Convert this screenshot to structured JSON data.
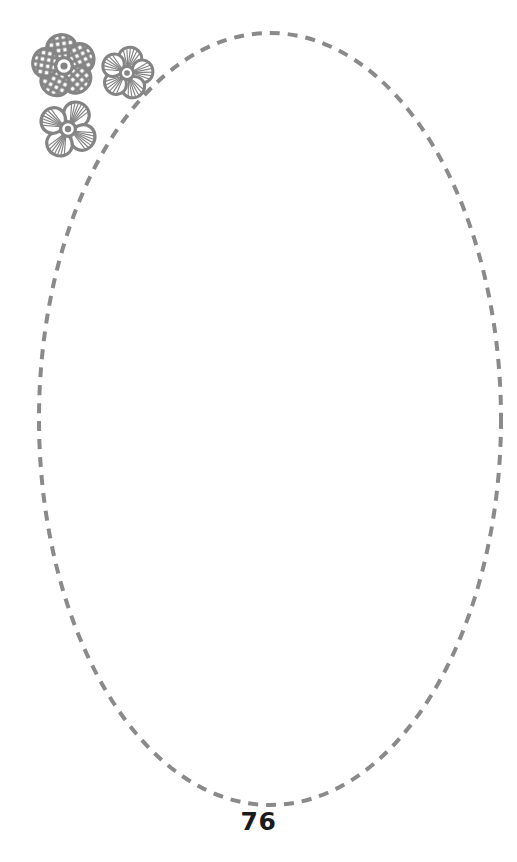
{
  "page": {
    "number": "76",
    "width": 517,
    "height": 862,
    "background_color": "#ffffff"
  },
  "frame": {
    "name": "dashed-oval-frame",
    "shape": "ellipse",
    "center_x": 270,
    "center_y": 419,
    "radius_x": 231,
    "radius_y": 386,
    "stroke_color": "#8a8a8a",
    "stroke_width": 4,
    "dash_length": 10,
    "dash_gap": 8,
    "fill": "none"
  },
  "decoration": {
    "name": "flower-cluster",
    "color": "#848484",
    "count": 3,
    "flowers": [
      {
        "name": "flower-large-dashed-petals",
        "center_x": 64,
        "center_y": 66,
        "radius": 29,
        "petals": 5,
        "petal_texture": "dashed-blocks",
        "center_ring": true
      },
      {
        "name": "flower-small-striped-petals",
        "center_x": 127,
        "center_y": 73,
        "radius": 24,
        "petals": 5,
        "petal_texture": "radiating-lines",
        "center_ring": true
      },
      {
        "name": "flower-medium-fan-petals",
        "center_x": 68,
        "center_y": 129,
        "radius": 27,
        "petals": 4,
        "petal_texture": "radiating-lines",
        "center_ring": true
      }
    ]
  }
}
